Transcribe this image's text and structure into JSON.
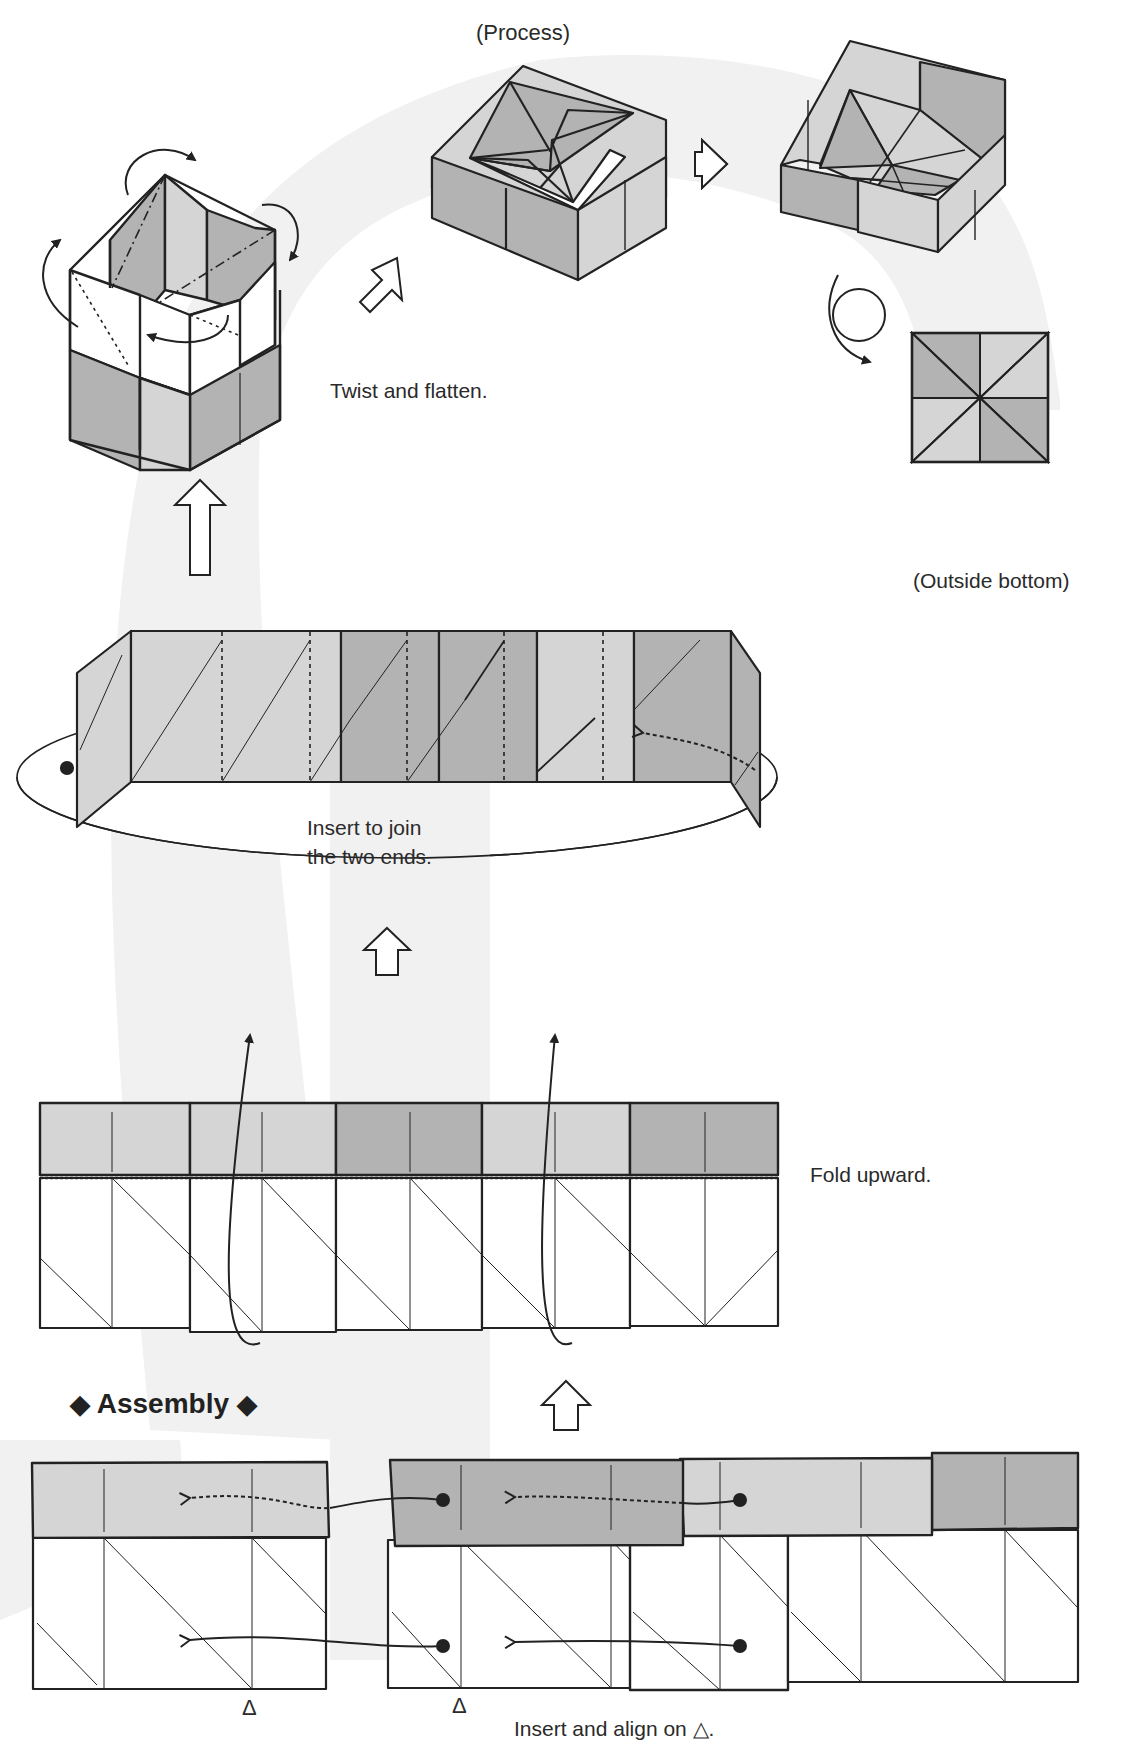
{
  "colors": {
    "band": "#f1f1f1",
    "dark_gray": "#b3b3b3",
    "light_gray": "#d5d5d5",
    "line": "#222222",
    "white": "#ffffff"
  },
  "steps": {
    "process_label": "(Process)",
    "twist_label": "Twist and flatten.",
    "outside_bottom_label": "(Outside bottom)",
    "insert_join_line1": "Insert to join",
    "insert_join_line2": "the two ends.",
    "fold_upward_label": "Fold upward.",
    "section_title": "Assembly",
    "section_title_marker_left": "◆",
    "section_title_marker_right": "◆",
    "insert_align_label": "Insert and align on △.",
    "align_marker": "Δ"
  },
  "icons": {
    "hollow_arrow": "hollow-arrow",
    "curved_arrow": "curved-arrow",
    "turn_over": "turn-over-arrow",
    "dot": "insertion-dot"
  }
}
